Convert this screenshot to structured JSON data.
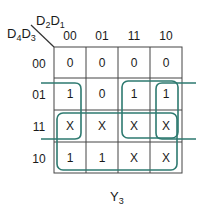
{
  "kmap": {
    "col_var_a": "D",
    "col_var_a_sub": "2",
    "col_var_b": "D",
    "col_var_b_sub": "1",
    "row_var_a": "D",
    "row_var_a_sub": "4",
    "row_var_b": "D",
    "row_var_b_sub": "3",
    "col_headers": [
      "00",
      "01",
      "11",
      "10"
    ],
    "row_headers": [
      "00",
      "01",
      "11",
      "10"
    ],
    "cells": [
      [
        "0",
        "0",
        "0",
        "0"
      ],
      [
        "1",
        "0",
        "1",
        "1"
      ],
      [
        "X",
        "X",
        "X",
        "X"
      ],
      [
        "1",
        "1",
        "X",
        "X"
      ]
    ],
    "output_label": "Y",
    "output_sub": "3",
    "group_color": "#2e7a70"
  }
}
